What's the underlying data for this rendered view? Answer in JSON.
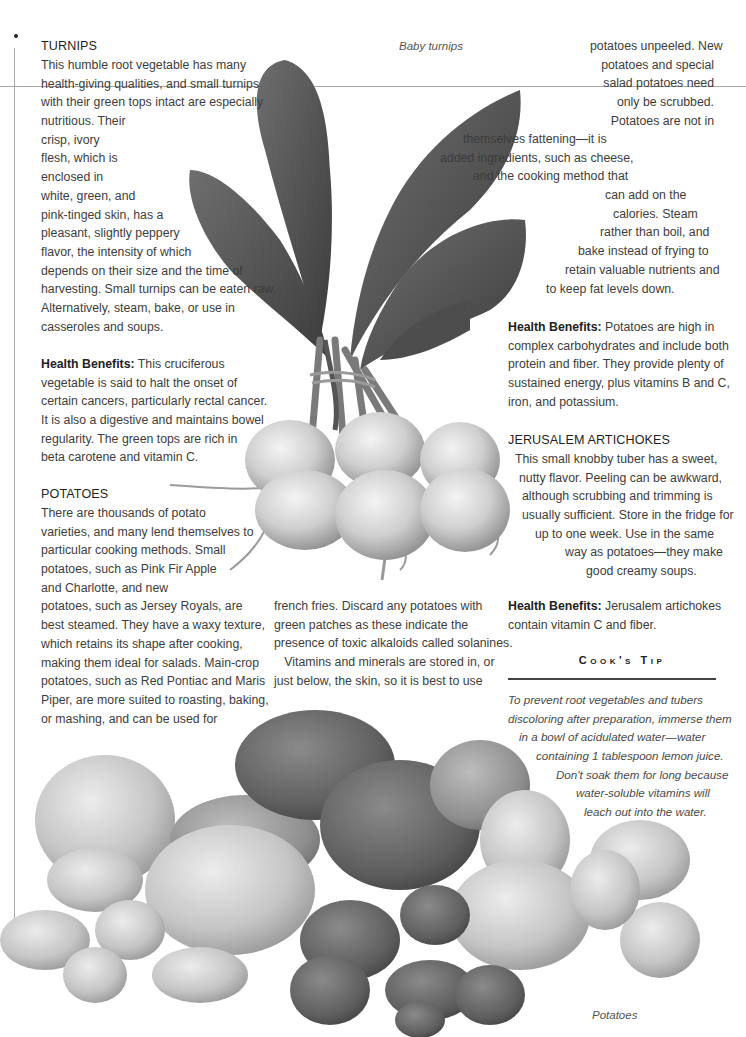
{
  "page": {
    "background": "#ffffff",
    "text_color": "#3d3d3d",
    "image_mode": "grayscale"
  },
  "captions": {
    "turnips": "Baby turnips",
    "potatoes": "Potatoes"
  },
  "turnips": {
    "heading": "TURNIPS",
    "body_lines": [
      "This humble root vegetable has many",
      "health-giving qualities, and small turnips",
      "with their green tops intact are especially",
      "nutritious. Their",
      "crisp, ivory",
      "flesh, which is",
      "enclosed in",
      "white, green, and",
      "pink-tinged skin, has a",
      "pleasant, slightly peppery",
      "flavor, the intensity of which",
      "depends on their size and the time of",
      "harvesting. Small turnips can be eaten raw.",
      "Alternatively, steam, bake, or use in",
      "casseroles and soups."
    ],
    "health_label": "Health Benefits:",
    "health_lines": [
      " This cruciferous",
      "vegetable is said to halt the onset of",
      "certain cancers, particularly rectal cancer.",
      "It is also a digestive and maintains bowel",
      "regularity. The green tops are rich in",
      "beta carotene and vitamin C."
    ]
  },
  "potatoes": {
    "heading": "POTATOES",
    "col1_lines": [
      "There are thousands of potato",
      "varieties, and many lend themselves to",
      "particular cooking methods. Small",
      "potatoes, such as Pink Fir Apple",
      "and Charlotte, and new",
      "potatoes, such as Jersey Royals, are",
      "best steamed. They have a waxy texture,",
      "which retains its shape after cooking,",
      "making them ideal for salads. Main-crop",
      "potatoes, such as Red Pontiac and Maris",
      "Piper, are more suited to roasting, baking,",
      "or mashing, and can be used for"
    ],
    "col2_lines": [
      "french fries. Discard any potatoes with",
      "green patches as these indicate the",
      "presence of toxic alkaloids called solanines.",
      "   Vitamins and minerals are stored in, or",
      "just below, the skin, so it is best to use"
    ],
    "col3_lines": [
      "potatoes unpeeled. New",
      "potatoes and special",
      "salad potatoes need",
      "only be scrubbed.",
      "Potatoes are not in",
      "themselves fattening—it is",
      "added ingredients, such as cheese,",
      "and the cooking method that",
      "can add on the",
      "calories. Steam",
      "rather than boil, and",
      "bake instead of frying to",
      "retain valuable nutrients and",
      "to keep fat levels down."
    ],
    "health_label": "Health Benefits:",
    "health_lines": [
      " Potatoes are high in",
      "complex carbohydrates and include both",
      "protein and fiber. They provide plenty of",
      "sustained energy, plus vitamins B and C,",
      "iron, and potassium."
    ]
  },
  "jerusalem": {
    "heading": "JERUSALEM ARTICHOKES",
    "body_lines": [
      "This small knobby tuber has a sweet,",
      "nutty flavor. Peeling can be awkward,",
      "although scrubbing and trimming is",
      "usually sufficient. Store in the fridge for",
      "up to one week. Use in the same",
      "way as potatoes—they make",
      "good creamy soups."
    ],
    "health_label": "Health Benefits:",
    "health_lines": [
      " Jerusalem artichokes",
      "contain vitamin C and fiber."
    ]
  },
  "cooks_tip": {
    "title": "Cook's Tip",
    "lines": [
      "To prevent root vegetables and tubers",
      "discoloring after preparation, immerse them",
      "in a bowl of acidulated water—water",
      "containing 1 tablespoon lemon juice.",
      "Don't soak them for long because",
      "water-soluble vitamins will",
      "leach out into the water."
    ]
  }
}
